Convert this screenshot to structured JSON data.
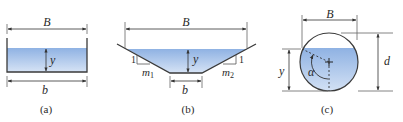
{
  "figure": {
    "colors": {
      "water_top": "#8fb2e3",
      "water_bottom": "#d3e1f4",
      "line": "#3a3a3a",
      "dim": "#555555"
    },
    "panels": [
      {
        "id": "a",
        "shape": "rectangular",
        "caption": "(a)",
        "labels": {
          "top_width": "B",
          "depth": "y",
          "bottom_width": "b"
        }
      },
      {
        "id": "b",
        "shape": "trapezoidal",
        "caption": "(b)",
        "labels": {
          "top_width": "B",
          "depth": "y",
          "bottom_width": "b",
          "left_slope_rise": "1",
          "left_slope_run": "m",
          "left_slope_run_sub": "1",
          "right_slope_rise": "1",
          "right_slope_run": "m",
          "right_slope_run_sub": "2"
        }
      },
      {
        "id": "c",
        "shape": "circular",
        "caption": "(c)",
        "labels": {
          "top_width": "B",
          "depth": "y",
          "diameter": "d",
          "angle": "α"
        }
      }
    ]
  }
}
